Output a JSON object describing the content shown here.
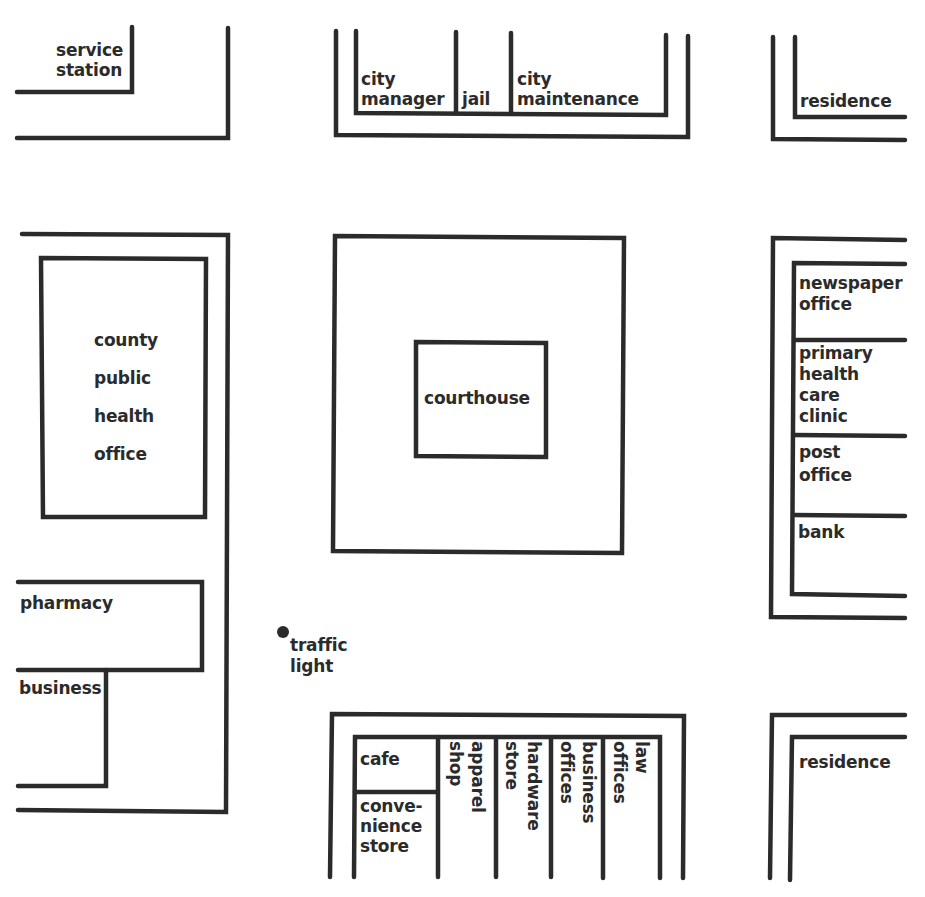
{
  "map": {
    "line_color": "#2b2b2b",
    "background": "#ffffff",
    "top_left_block": {
      "service_station": "service\nstation"
    },
    "top_center_block": {
      "city_manager": "city\nmanager",
      "jail": "jail",
      "city_maintenance": "city\nmaintenance"
    },
    "top_right_block": {
      "residence": "residence"
    },
    "left_block": {
      "county_public_health_office": "county\npublic\nhealth\noffice"
    },
    "center_block": {
      "courthouse": "courthouse"
    },
    "right_block": {
      "newspaper_office": "newspaper\noffice",
      "primary_health_care_clinic": "primary\nhealth\ncare\nclinic",
      "post_office": "post\noffice",
      "bank": "bank"
    },
    "bottom_left_block": {
      "pharmacy": "pharmacy",
      "business": "business"
    },
    "street": {
      "traffic_light": "traffic\nlight"
    },
    "bottom_center_block": {
      "cafe": "cafe",
      "convenience_store": "conve-\nnience\nstore",
      "apparel_shop": "apparel\nshop",
      "hardware_store": "hardware\nstore",
      "business_offices": "business\noffices",
      "law_offices": "law\noffices"
    },
    "bottom_right_block": {
      "residence": "residence"
    }
  }
}
